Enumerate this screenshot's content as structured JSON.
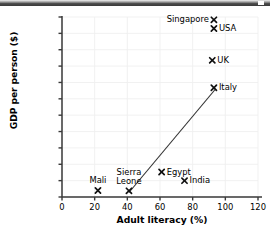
{
  "chart_data": {
    "type": "scatter",
    "title": "",
    "xlabel": "Adult literacy (%)",
    "ylabel": "GDP per person ($)",
    "xlim": [
      0,
      120
    ],
    "ylim": [
      0,
      44000
    ],
    "xticks": [
      "0",
      "20",
      "40",
      "60",
      "80",
      "100",
      "120"
    ],
    "xtick_values": [
      0,
      20,
      40,
      60,
      80,
      100,
      120
    ],
    "yticks": [
      "0",
      "4000",
      "8000",
      "12000",
      "16000",
      "20000",
      "24000",
      "28000",
      "32000",
      "36000",
      "40000",
      "44000"
    ],
    "ytick_values": [
      0,
      4000,
      8000,
      12000,
      16000,
      20000,
      24000,
      28000,
      32000,
      36000,
      40000,
      44000
    ],
    "grid": true,
    "legend": "none",
    "marker": "x-cross",
    "points": [
      {
        "label": "Mali",
        "x": 22,
        "y": 1600,
        "label_pos": "above"
      },
      {
        "label": "Sierra Leone",
        "x": 41,
        "y": 1500,
        "label_pos": "above"
      },
      {
        "label": "Egypt",
        "x": 61,
        "y": 6100,
        "label_pos": "right"
      },
      {
        "label": "India",
        "x": 75,
        "y": 4000,
        "label_pos": "right"
      },
      {
        "label": "Italy",
        "x": 93,
        "y": 26700,
        "label_pos": "right"
      },
      {
        "label": "UK",
        "x": 92,
        "y": 33400,
        "label_pos": "right"
      },
      {
        "label": "USA",
        "x": 93,
        "y": 41200,
        "label_pos": "right"
      },
      {
        "label": "Singapore",
        "x": 93,
        "y": 43300,
        "label_pos": "left"
      }
    ],
    "trendline": {
      "x0": 41,
      "y0": 1100,
      "x1": 94,
      "y1": 26400
    }
  }
}
